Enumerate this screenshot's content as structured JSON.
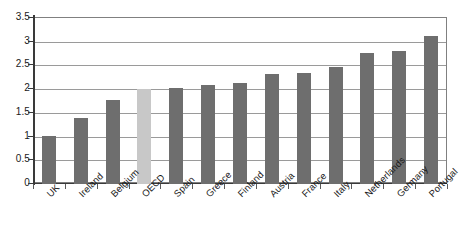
{
  "chart_data": {
    "type": "bar",
    "title": "",
    "subtitle": "",
    "xlabel": "",
    "ylabel": "",
    "ylim": [
      0,
      3.5
    ],
    "yticks": [
      "0",
      "0.5",
      "1",
      "1.5",
      "2",
      "2.5",
      "3",
      "3.5"
    ],
    "ytick_values": [
      0,
      0.5,
      1,
      1.5,
      2,
      2.5,
      3,
      3.5
    ],
    "grid": true,
    "legend": "none",
    "categories": [
      "UK",
      "Ireland",
      "Belgium",
      "OECD",
      "Spain",
      "Greece",
      "Finland",
      "Austria",
      "France",
      "Italy",
      "Netherlands",
      "Germany",
      "Portugal"
    ],
    "values": [
      1.02,
      1.4,
      1.78,
      2.01,
      2.02,
      2.08,
      2.13,
      2.31,
      2.34,
      2.47,
      2.76,
      2.81,
      3.12
    ],
    "bar_colors": [
      "#6e6e6e",
      "#6e6e6e",
      "#6e6e6e",
      "#c8c8c8",
      "#6e6e6e",
      "#6e6e6e",
      "#6e6e6e",
      "#6e6e6e",
      "#6e6e6e",
      "#6e6e6e",
      "#6e6e6e",
      "#6e6e6e",
      "#6e6e6e"
    ],
    "highlight_category": "OECD",
    "colors": {
      "bar_default": "#6e6e6e",
      "bar_highlight": "#c8c8c8",
      "gridline": "#9a9a9a",
      "axis": "#3a3a3a",
      "frame": "#808080",
      "text": "#1a1a1a",
      "background": "#ffffff"
    }
  }
}
